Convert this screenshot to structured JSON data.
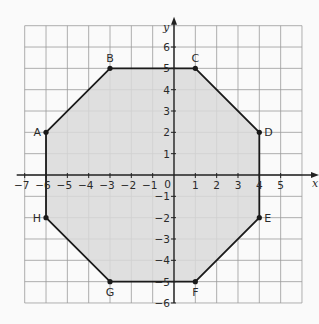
{
  "diagram": {
    "type": "coordinate-plane-polygon",
    "grid": {
      "xmin": -7,
      "xmax": 6,
      "ymin": -6,
      "ymax": 7,
      "cell_px": 21.33,
      "origin_px": [
        174,
        175
      ]
    },
    "axes": {
      "x_label": "x",
      "y_label": "y",
      "x_ticks": [
        -7,
        -6,
        -5,
        -4,
        -3,
        -2,
        -1,
        1,
        2,
        3,
        4,
        5
      ],
      "y_ticks": [
        6,
        5,
        4,
        3,
        2,
        1,
        -1,
        -2,
        -3,
        -4,
        -5,
        -6
      ],
      "origin_label": "0"
    },
    "polygon": {
      "name": "octagon ABCDEFGH",
      "fill": "#d9d9d9",
      "stroke": "#1a1a1a",
      "vertices": [
        {
          "label": "A",
          "x": -6,
          "y": 2,
          "label_pos": "left"
        },
        {
          "label": "B",
          "x": -3,
          "y": 5,
          "label_pos": "above"
        },
        {
          "label": "C",
          "x": 1,
          "y": 5,
          "label_pos": "above"
        },
        {
          "label": "D",
          "x": 4,
          "y": 2,
          "label_pos": "right"
        },
        {
          "label": "E",
          "x": 4,
          "y": -2,
          "label_pos": "right"
        },
        {
          "label": "F",
          "x": 1,
          "y": -5,
          "label_pos": "below"
        },
        {
          "label": "G",
          "x": -3,
          "y": -5,
          "label_pos": "below"
        },
        {
          "label": "H",
          "x": -6,
          "y": -2,
          "label_pos": "left"
        }
      ]
    },
    "colors": {
      "grid": "#9a9a9a",
      "axis": "#222222",
      "background": "#fafafa"
    }
  }
}
